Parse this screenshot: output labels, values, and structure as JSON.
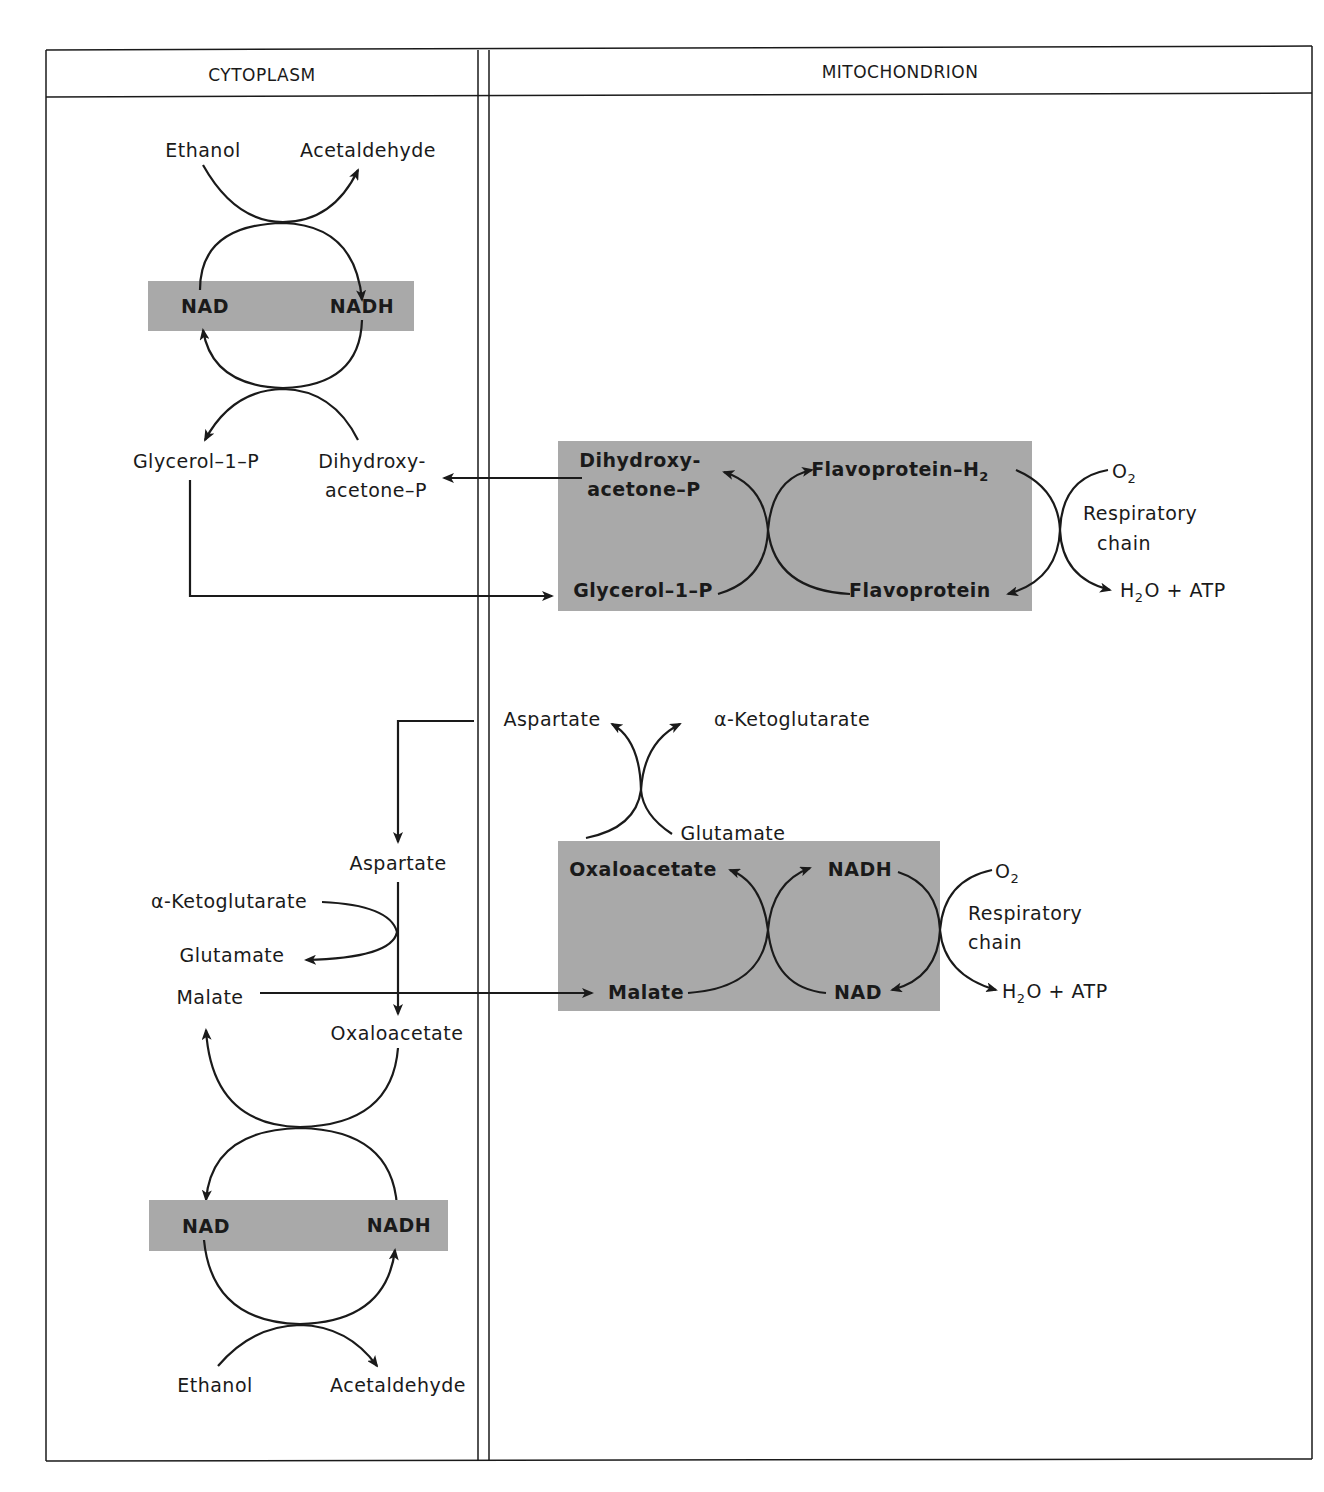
{
  "figure": {
    "columns": {
      "left": "CYTOPLASM",
      "right": "MITOCHONDRION"
    },
    "colors": {
      "shade": "#a9a9a9",
      "line": "#1a1a1a",
      "background": "#ffffff"
    },
    "cytoplasm_top": {
      "ethanol": "Ethanol",
      "acetaldehyde": "Acetaldehyde",
      "nad": "NAD",
      "nadh": "NADH",
      "glycerol_1_p": "Glycerol–1–P",
      "dihydroxy_line1": "Dihydroxy-",
      "dihydroxy_line2": "acetone–P"
    },
    "glycerol_shuttle": {
      "dihydroxy_line1": "Dihydroxy-",
      "dihydroxy_line2": "acetone–P",
      "glycerol_1_p": "Glycerol–1–P",
      "flavoprotein_h2": "Flavoprotein–H",
      "flavoprotein_h2_sub": "2",
      "flavoprotein": "Flavoprotein",
      "o2": "O",
      "o2_sub": "2",
      "respiratory_line1": "Respiratory",
      "respiratory_line2": "chain",
      "h2o": "H",
      "h2o_sub": "2",
      "h2o_rest": "O + ATP"
    },
    "malate_shuttle_mito": {
      "aspartate": "Aspartate",
      "alpha_ketoglutarate": "α-Ketoglutarate",
      "glutamate": "Glutamate",
      "oxaloacetate": "Oxaloacetate",
      "nadh": "NADH",
      "malate": "Malate",
      "nad": "NAD",
      "o2": "O",
      "o2_sub": "2",
      "respiratory_line1": "Respiratory",
      "respiratory_line2": "chain",
      "h2o": "H",
      "h2o_sub": "2",
      "h2o_rest": "O + ATP"
    },
    "cytoplasm_bottom": {
      "aspartate": "Aspartate",
      "alpha_ketoglutarate": "α-Ketoglutarate",
      "glutamate": "Glutamate",
      "malate": "Malate",
      "oxaloacetate": "Oxaloacetate",
      "nad": "NAD",
      "nadh": "NADH",
      "ethanol": "Ethanol",
      "acetaldehyde": "Acetaldehyde"
    }
  }
}
